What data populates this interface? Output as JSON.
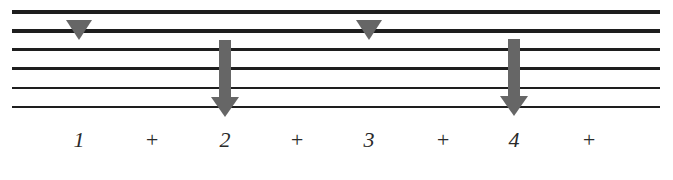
{
  "diagram": {
    "type": "strum-pattern",
    "colors": {
      "strings": "#1e1e1e",
      "markers": "#666666",
      "counts": "#2a2a2a",
      "background": "#ffffff"
    },
    "strings": [
      {
        "index": 1,
        "y": 10,
        "thickness": 4
      },
      {
        "index": 2,
        "y": 29,
        "thickness": 3.5
      },
      {
        "index": 3,
        "y": 48,
        "thickness": 3
      },
      {
        "index": 4,
        "y": 67,
        "thickness": 2.5
      },
      {
        "index": 5,
        "y": 87,
        "thickness": 2
      },
      {
        "index": 6,
        "y": 106,
        "thickness": 1.5
      }
    ],
    "markers": [
      {
        "kind": "triangle-down",
        "beat": "1",
        "x": 79
      },
      {
        "kind": "down-strum-arrow",
        "beat": "2",
        "x": 225
      },
      {
        "kind": "triangle-down",
        "beat": "3",
        "x": 369
      },
      {
        "kind": "down-strum-arrow",
        "beat": "4",
        "x": 514
      }
    ],
    "counts": [
      {
        "label": "1",
        "x": 79
      },
      {
        "label": "+",
        "x": 152
      },
      {
        "label": "2",
        "x": 225
      },
      {
        "label": "+",
        "x": 297
      },
      {
        "label": "3",
        "x": 369
      },
      {
        "label": "+",
        "x": 443
      },
      {
        "label": "4",
        "x": 514
      },
      {
        "label": "+",
        "x": 589
      }
    ]
  }
}
